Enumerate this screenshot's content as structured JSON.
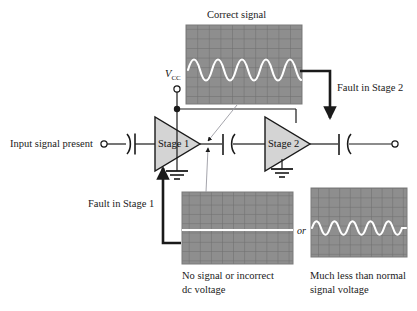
{
  "figure": {
    "title_correct_signal": "Correct signal",
    "label_input": "Input signal present",
    "label_vcc": "V",
    "label_vcc_sub": "CC",
    "label_stage1": "Stage 1",
    "label_stage2": "Stage 2",
    "label_fault_stage1": "Fault in Stage 1",
    "label_fault_stage2": "Fault in Stage 2",
    "label_or": "or",
    "caption_bottom_left_line1": "No signal or incorrect",
    "caption_bottom_left_line2": "dc voltage",
    "caption_bottom_right_line1": "Much less than normal",
    "caption_bottom_right_line2": "signal voltage"
  },
  "colors": {
    "ink": "#1a1a1a",
    "wire": "#1a1a1a",
    "scope_screen": "#8e8e8e",
    "scope_grid": "#6e6e6e",
    "scope_trace": "#ffffff",
    "triangle_fill": "#d0d0d0",
    "triangle_stroke": "#1a1a1a",
    "pointer_line": "#9a9aa2",
    "background": "#ffffff"
  },
  "scopes": [
    {
      "name": "correct-signal-scope",
      "trace": "sine",
      "cycles": 4,
      "amplitude_divisions": 1.6,
      "grid_cols": 10,
      "grid_rows": 8,
      "caption": "Correct signal"
    },
    {
      "name": "no-signal-scope",
      "trace": "flat",
      "cycles": 0,
      "amplitude_divisions": 0,
      "grid_cols": 10,
      "grid_rows": 8,
      "caption": "No signal or incorrect dc voltage"
    },
    {
      "name": "low-signal-scope",
      "trace": "sine",
      "cycles": 4,
      "amplitude_divisions": 0.7,
      "grid_cols": 10,
      "grid_rows": 8,
      "caption": "Much less than normal signal voltage"
    }
  ],
  "circuit": {
    "terminals": [
      "input-terminal",
      "vcc-terminal",
      "output-terminal"
    ],
    "capacitors": [
      "input-coupling-capacitor",
      "interstage-coupling-capacitor",
      "output-coupling-capacitor"
    ],
    "grounds": [
      "stage1-ground",
      "stage2-ground"
    ],
    "junction": "vcc-junction-dot"
  }
}
